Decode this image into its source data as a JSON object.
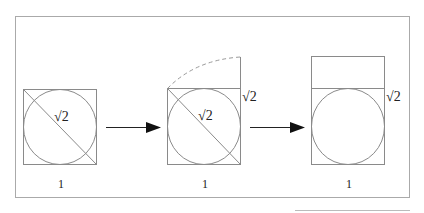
{
  "diagram": {
    "panels": [
      {
        "id": "square-with-circle",
        "diagonal_label": "√2",
        "bottom_label": "1"
      },
      {
        "id": "rotated-diagonal-up",
        "diagonal_label": "√2",
        "side_label": "√2",
        "bottom_label": "1"
      },
      {
        "id": "rectangle-with-circle",
        "side_label": "√2",
        "bottom_label": "1"
      }
    ],
    "colors": {
      "stroke": "#8a8a8a",
      "arrow": "#111111",
      "frame": "#aaaaaa",
      "text": "#222222"
    }
  }
}
